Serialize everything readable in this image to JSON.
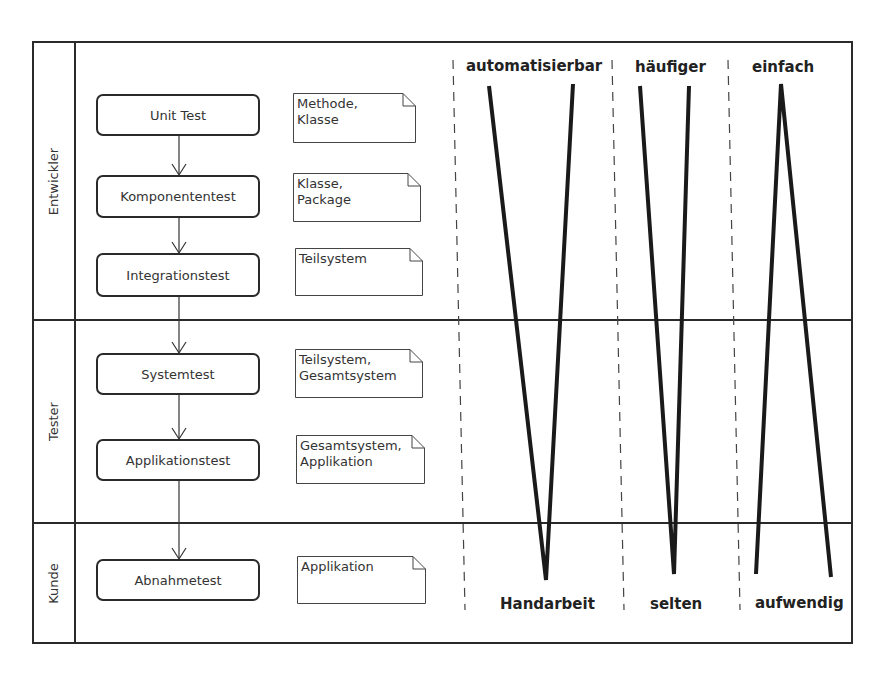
{
  "lanes": [
    {
      "label": "Entwickler"
    },
    {
      "label": "Tester"
    },
    {
      "label": "Kunde"
    }
  ],
  "activities": [
    {
      "label": "Unit Test",
      "note": "Methode,\nKlasse"
    },
    {
      "label": "Komponententest",
      "note": "Klasse,\nPackage"
    },
    {
      "label": "Integrationstest",
      "note": "Teilsystem"
    },
    {
      "label": "Systemtest",
      "note": "Teilsystem,\nGesamtsystem"
    },
    {
      "label": "Applikationstest",
      "note": "Gesamtsystem,\nApplikation"
    },
    {
      "label": "Abnahmetest",
      "note": "Applikation"
    }
  ],
  "scales": [
    {
      "top": "automatisierbar",
      "bottom": "Handarbeit"
    },
    {
      "top": "häufiger",
      "bottom": "selten"
    },
    {
      "top": "einfach",
      "bottom": "aufwendig"
    }
  ]
}
